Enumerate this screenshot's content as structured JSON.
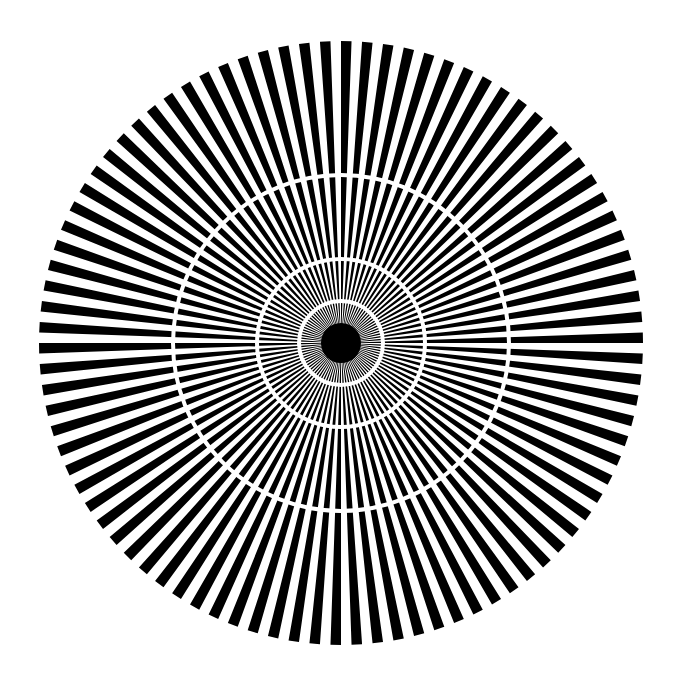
{
  "pattern": {
    "type": "siemens-star",
    "center": [
      341,
      343
    ],
    "outer_radius": 302,
    "spoke_count": 90,
    "ring_gap_radii": [
      168,
      84,
      42
    ],
    "ring_gap_width": 4,
    "foreground": "#000000",
    "background": "#ffffff"
  }
}
